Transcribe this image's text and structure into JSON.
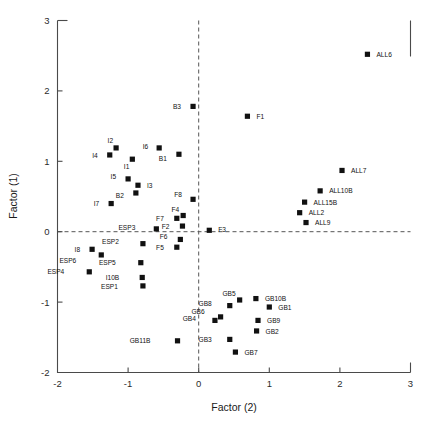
{
  "chart_data": {
    "type": "scatter",
    "title": "",
    "xlabel": "Factor (2)",
    "ylabel": "Factor (1)",
    "xlim": [
      -2,
      3
    ],
    "ylim": [
      -2,
      3
    ],
    "xticks": [
      -2,
      -1,
      0,
      1,
      2,
      3
    ],
    "yticks": [
      -2,
      -1,
      0,
      1,
      2,
      3
    ],
    "xtick_labels": [
      "-2",
      "-1",
      "0",
      "1",
      "2",
      "3"
    ],
    "ytick_labels": [
      "-2",
      "-1",
      "0",
      "1",
      "2",
      "3"
    ],
    "grid": false,
    "legend": "none",
    "reference_lines": [
      {
        "axis": "x",
        "value": 0,
        "style": "dashed"
      },
      {
        "axis": "y",
        "value": 0,
        "style": "dashed"
      }
    ],
    "marker": "square",
    "marker_color": "#111111",
    "points": [
      {
        "label": "ALL6",
        "x": 2.39,
        "y": 2.52,
        "lx": 9,
        "ly": 2.6
      },
      {
        "label": "B3",
        "x": -0.08,
        "y": 1.78,
        "lx": -12,
        "ly": 2.6
      },
      {
        "label": "F1",
        "x": 0.69,
        "y": 1.64,
        "lx": 9,
        "ly": 2.6
      },
      {
        "label": "I2",
        "x": -1.17,
        "y": 1.19,
        "lx": -3,
        "ly": -5
      },
      {
        "label": "I6",
        "x": -0.56,
        "y": 1.19,
        "lx": -11,
        "ly": 1.5
      },
      {
        "label": "I4",
        "x": -1.26,
        "y": 1.09,
        "lx": -12,
        "ly": 2.6
      },
      {
        "label": "B1",
        "x": -0.28,
        "y": 1.1,
        "lx": -12,
        "ly": 7
      },
      {
        "label": "I1",
        "x": -0.94,
        "y": 1.03,
        "lx": -3,
        "ly": 10
      },
      {
        "label": "ALL7",
        "x": 2.03,
        "y": 0.87,
        "lx": 9,
        "ly": 2.6
      },
      {
        "label": "I5",
        "x": -1.0,
        "y": 0.75,
        "lx": -12,
        "ly": 0
      },
      {
        "label": "I3",
        "x": -0.86,
        "y": 0.66,
        "lx": 9,
        "ly": 2.6
      },
      {
        "label": "ALL10B",
        "x": 1.72,
        "y": 0.58,
        "lx": 9,
        "ly": 2.6
      },
      {
        "label": "B2",
        "x": -0.89,
        "y": 0.55,
        "lx": -12,
        "ly": 5
      },
      {
        "label": "F8",
        "x": -0.08,
        "y": 0.46,
        "lx": -11,
        "ly": -2
      },
      {
        "label": "ALL15B",
        "x": 1.5,
        "y": 0.42,
        "lx": 9,
        "ly": 2.6
      },
      {
        "label": "I7",
        "x": -1.24,
        "y": 0.4,
        "lx": -12,
        "ly": 2.6
      },
      {
        "label": "ALL2",
        "x": 1.43,
        "y": 0.27,
        "lx": 9,
        "ly": 2.6
      },
      {
        "label": "F4",
        "x": -0.22,
        "y": 0.23,
        "lx": -4,
        "ly": -4
      },
      {
        "label": "F7",
        "x": -0.31,
        "y": 0.19,
        "lx": -13,
        "ly": 2.6
      },
      {
        "label": "ALL9",
        "x": 1.52,
        "y": 0.13,
        "lx": 9,
        "ly": 2.6
      },
      {
        "label": "F2",
        "x": -0.23,
        "y": 0.08,
        "lx": -13,
        "ly": 2.6
      },
      {
        "label": "ESP3",
        "x": -0.6,
        "y": 0.04,
        "lx": -21,
        "ly": 1.5
      },
      {
        "label": "F3",
        "x": 0.15,
        "y": 0.02,
        "lx": 9,
        "ly": 1.5
      },
      {
        "label": "F6",
        "x": -0.26,
        "y": -0.11,
        "lx": -13,
        "ly": 0
      },
      {
        "label": "ESP2",
        "x": -0.79,
        "y": -0.17,
        "lx": -24,
        "ly": 0
      },
      {
        "label": "F5",
        "x": -0.31,
        "y": -0.22,
        "lx": -13,
        "ly": 2.6
      },
      {
        "label": "I8",
        "x": -1.51,
        "y": -0.25,
        "lx": -12,
        "ly": 2.6
      },
      {
        "label": "ESP6",
        "x": -1.38,
        "y": -0.33,
        "lx": -25,
        "ly": 8
      },
      {
        "label": "ESP5",
        "x": -0.82,
        "y": -0.44,
        "lx": -25,
        "ly": 2.6
      },
      {
        "label": "ESP4",
        "x": -1.55,
        "y": -0.57,
        "lx": -25,
        "ly": 2.6
      },
      {
        "label": "I10B",
        "x": -0.8,
        "y": -0.65,
        "lx": -23,
        "ly": 2.6
      },
      {
        "label": "ESP1",
        "x": -0.79,
        "y": -0.77,
        "lx": -25,
        "ly": 2.6
      },
      {
        "label": "GB5",
        "x": 0.58,
        "y": -0.97,
        "lx": -4,
        "ly": -4
      },
      {
        "label": "GB10B",
        "x": 0.81,
        "y": -0.95,
        "lx": 9,
        "ly": 2.6
      },
      {
        "label": "GB8",
        "x": 0.44,
        "y": -1.05,
        "lx": -18,
        "ly": 0
      },
      {
        "label": "GB1",
        "x": 1.0,
        "y": -1.07,
        "lx": 9,
        "ly": 2.6
      },
      {
        "label": "GB6",
        "x": 0.31,
        "y": -1.21,
        "lx": -16,
        "ly": -3
      },
      {
        "label": "GB4",
        "x": 0.23,
        "y": -1.26,
        "lx": -19,
        "ly": 1
      },
      {
        "label": "GB9",
        "x": 0.84,
        "y": -1.26,
        "lx": 9,
        "ly": 2.6
      },
      {
        "label": "GB2",
        "x": 0.82,
        "y": -1.41,
        "lx": 9,
        "ly": 2.6
      },
      {
        "label": "GB3",
        "x": 0.44,
        "y": -1.53,
        "lx": -18,
        "ly": 2.6
      },
      {
        "label": "GB11B",
        "x": -0.3,
        "y": -1.55,
        "lx": -27,
        "ly": 2.6
      },
      {
        "label": "GB7",
        "x": 0.52,
        "y": -1.71,
        "lx": 9,
        "ly": 2.6
      }
    ]
  }
}
